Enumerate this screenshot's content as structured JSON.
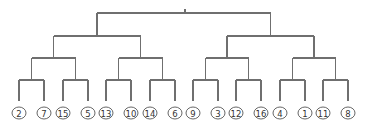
{
  "diagram": {
    "type": "dendrogram",
    "levels_y": [
      13,
      36,
      58,
      80
    ],
    "leaf_line_bottom_y": 101,
    "leaf_circle_y": 113,
    "leaf_circle_rx": 7,
    "leaf_circle_ry": 6,
    "root_tick": {
      "x": 185,
      "y1": 9,
      "y2": 13
    },
    "colors": {
      "edge": "#6f6f6f",
      "circle_stroke": "#555555",
      "label": "#333333"
    },
    "leaves": [
      {
        "label": "2",
        "x": 19
      },
      {
        "label": "7",
        "x": 44
      },
      {
        "label": "15",
        "x": 63
      },
      {
        "label": "5",
        "x": 88
      },
      {
        "label": "13",
        "x": 106
      },
      {
        "label": "10",
        "x": 131
      },
      {
        "label": "14",
        "x": 150
      },
      {
        "label": "6",
        "x": 175
      },
      {
        "label": "9",
        "x": 193
      },
      {
        "label": "3",
        "x": 218
      },
      {
        "label": "12",
        "x": 236
      },
      {
        "label": "16",
        "x": 261
      },
      {
        "label": "4",
        "x": 280
      },
      {
        "label": "1",
        "x": 305
      },
      {
        "label": "11",
        "x": 323
      },
      {
        "label": "8",
        "x": 348
      }
    ],
    "tree": [
      [
        [
          [
            "2",
            "7"
          ],
          [
            "15",
            "5"
          ]
        ],
        [
          [
            "13",
            "10"
          ],
          [
            "14",
            "6"
          ]
        ]
      ],
      [
        [
          [
            "9",
            "3"
          ],
          [
            "12",
            "16"
          ]
        ],
        [
          [
            "4",
            "1"
          ],
          [
            "11",
            "8"
          ]
        ]
      ]
    ]
  }
}
